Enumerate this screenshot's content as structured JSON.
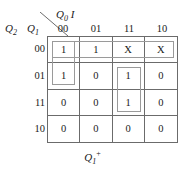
{
  "diagram": {
    "type": "karnaugh-map",
    "column_variables": {
      "text": "Q0 I",
      "base": "Q",
      "sub": "0",
      "second": "I"
    },
    "row_variables": {
      "q2": {
        "base": "Q",
        "sub": "2"
      },
      "q1": {
        "base": "Q",
        "sub": "1"
      }
    },
    "output_label": {
      "base": "Q",
      "sub": "1",
      "sup": "+"
    },
    "column_headers": [
      "00",
      "01",
      "11",
      "10"
    ],
    "row_headers": [
      "00",
      "01",
      "11",
      "10"
    ],
    "cells": [
      [
        "1",
        "1",
        "X",
        "X"
      ],
      [
        "1",
        "0",
        "1",
        "0"
      ],
      [
        "0",
        "0",
        "1",
        "0"
      ],
      [
        "0",
        "0",
        "0",
        "0"
      ]
    ],
    "groups": [
      {
        "name": "row-00-full-span",
        "row": 0,
        "col": 0,
        "rowspan": 1,
        "colspan": 4
      },
      {
        "name": "col-00-rows-00-01",
        "row": 0,
        "col": 0,
        "rowspan": 2,
        "colspan": 1
      },
      {
        "name": "col-11-rows-01-11",
        "row": 1,
        "col": 2,
        "rowspan": 2,
        "colspan": 1
      }
    ],
    "colors": {
      "grid_line": "#6b6b6b",
      "group_line": "#9a9a9a",
      "text": "#1a1a1a",
      "background": "#ffffff"
    }
  }
}
